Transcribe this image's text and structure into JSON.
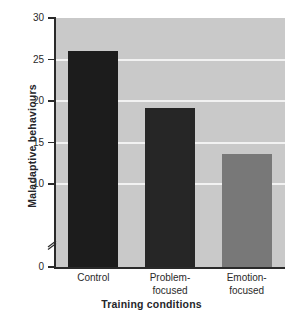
{
  "chart_data": {
    "type": "bar",
    "title": "",
    "xlabel": "Training conditions",
    "ylabel": "Maladaptive behaviours",
    "categories": [
      "Control",
      "Problem-focused",
      "Emotion-focused"
    ],
    "values": [
      26.0,
      19.2,
      13.6
    ],
    "ylim": [
      0,
      30
    ],
    "yticks": [
      0,
      10,
      15,
      20,
      25,
      30
    ],
    "ytick_labels": [
      "0",
      "10",
      "15",
      "20",
      "25",
      "30"
    ],
    "grid": true,
    "grid_color": "#f2f2f2",
    "axis_break": true,
    "axis_break_between": [
      0,
      10
    ],
    "legend": "none",
    "plot_background": "#c9c9c9",
    "bar_colors": [
      "#1c1c1c",
      "#262626",
      "#787878"
    ],
    "bars": [
      {
        "category": "Control",
        "label_line1": "Control",
        "label_line2": "",
        "value": 26.0,
        "color": "#1c1c1c"
      },
      {
        "category": "Problem-focused",
        "label_line1": "Problem-",
        "label_line2": "focused",
        "value": 19.2,
        "color": "#262626"
      },
      {
        "category": "Emotion-focused",
        "label_line1": "Emotion-",
        "label_line2": "focused",
        "value": 13.6,
        "color": "#787878"
      }
    ]
  }
}
